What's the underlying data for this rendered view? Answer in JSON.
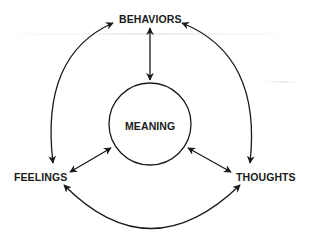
{
  "diagram": {
    "nodes": {
      "behaviors": "BEHAVIORS",
      "meaning": "MEANING",
      "feelings": "FEELINGS",
      "thoughts": "THOUGHTS"
    },
    "edges": [
      {
        "from": "BEHAVIORS",
        "to": "MEANING",
        "type": "bidirectional"
      },
      {
        "from": "FEELINGS",
        "to": "MEANING",
        "type": "bidirectional"
      },
      {
        "from": "THOUGHTS",
        "to": "MEANING",
        "type": "bidirectional"
      },
      {
        "from": "BEHAVIORS",
        "to": "FEELINGS",
        "type": "bidirectional-arc"
      },
      {
        "from": "BEHAVIORS",
        "to": "THOUGHTS",
        "type": "bidirectional-arc"
      },
      {
        "from": "FEELINGS",
        "to": "THOUGHTS",
        "type": "bidirectional-arc"
      }
    ],
    "stroke_color": "#1a1a1a"
  }
}
